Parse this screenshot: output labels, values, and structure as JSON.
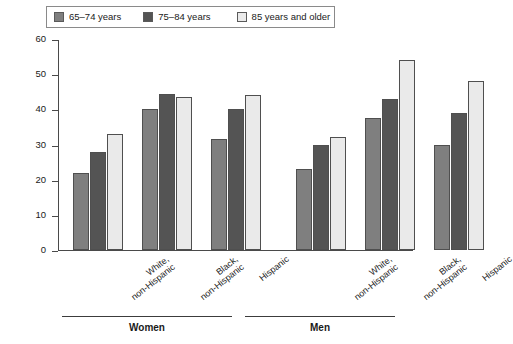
{
  "chart_data": {
    "type": "bar",
    "title": "",
    "xlabel": "",
    "ylabel": "Percent",
    "ylim": [
      0,
      60
    ],
    "yticks": [
      0,
      10,
      20,
      30,
      40,
      50,
      60
    ],
    "grid": false,
    "legend_position": "top",
    "categories": [
      "White, non-Hispanic",
      "Black, non-Hispanic",
      "Hispanic",
      "White, non-Hispanic",
      "Black, non-Hispanic",
      "Hispanic"
    ],
    "group_labels": [
      "Women",
      "Men"
    ],
    "series": [
      {
        "name": "65–74 years",
        "color": "#7f7f7f",
        "values": [
          22,
          40,
          31.5,
          23,
          37.5,
          30
        ]
      },
      {
        "name": "75–84 years",
        "color": "#545454",
        "values": [
          28,
          44.5,
          40,
          30,
          43,
          39
        ]
      },
      {
        "name": "85 years and older",
        "color": "#eaeaea",
        "values": [
          33,
          43.5,
          44,
          32,
          54,
          48
        ]
      }
    ]
  },
  "legend": {
    "items": [
      {
        "label": "65–74 years",
        "swatch": "legend-swatch-65-74"
      },
      {
        "label": "75–84 years",
        "swatch": "legend-swatch-75-84"
      },
      {
        "label": "85 years and older",
        "swatch": "legend-swatch-85-plus"
      }
    ]
  },
  "axes": {
    "y": {
      "label": "Percent",
      "ticks": [
        "60",
        "50",
        "40",
        "30",
        "20",
        "10",
        "0"
      ]
    },
    "x": {
      "cat_line1": [
        "White,",
        "Black,",
        "Hispanic",
        "White,",
        "Black,",
        "Hispanic"
      ],
      "cat_line2": [
        "non-Hispanic",
        "non-Hispanic",
        "",
        "non-Hispanic",
        "non-Hispanic",
        ""
      ]
    }
  },
  "groups": [
    {
      "label": "Women"
    },
    {
      "label": "Men"
    }
  ]
}
